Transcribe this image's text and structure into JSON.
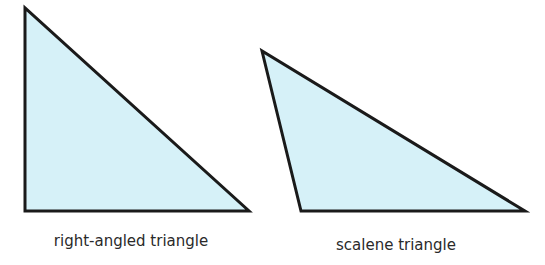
{
  "diagram": {
    "fill_color": "#d6f1f8",
    "stroke_color": "#1a1a1a",
    "shapes": [
      {
        "name": "right-angled triangle",
        "label": "right-angled triangle",
        "points": "25,8 25,211 249,211",
        "label_x": 131,
        "label_y": 232
      },
      {
        "name": "scalene triangle",
        "label": "scalene triangle",
        "points": "262,51 301,211 525,211",
        "label_x": 396,
        "label_y": 236
      }
    ]
  }
}
